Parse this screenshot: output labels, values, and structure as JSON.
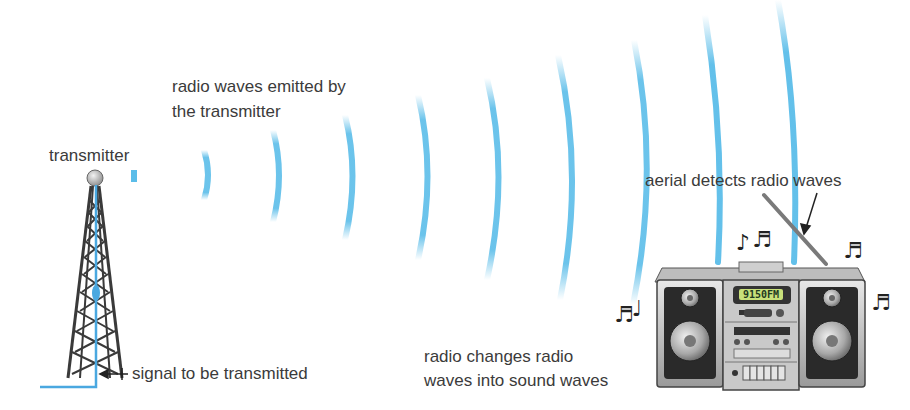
{
  "labels": {
    "transmitter": "transmitter",
    "waves_emitted_line1": "radio waves emitted by",
    "waves_emitted_line2": "the transmitter",
    "aerial": "aerial detects radio waves",
    "radio_changes_line1": "radio changes radio",
    "radio_changes_line2": "waves into sound waves",
    "signal": "signal to be transmitted"
  },
  "radio": {
    "display": "9150FM"
  },
  "colors": {
    "wave": "#5bbde9",
    "signal_line": "#4aa8e0",
    "tower": "#3a3a3a",
    "text": "#3b3b3b",
    "lcd": "#c8e07a"
  }
}
